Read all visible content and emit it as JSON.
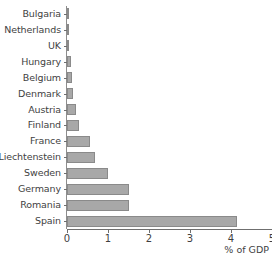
{
  "chart_data": {
    "type": "bar",
    "orientation": "horizontal",
    "title": "",
    "xlabel": "% of GDP",
    "ylabel": "",
    "xlim": [
      0,
      5
    ],
    "xticks": [
      0,
      1,
      2,
      3,
      4,
      5
    ],
    "xtick_labels": [
      "0",
      "1",
      "2",
      "3",
      "4",
      "5"
    ],
    "grid": false,
    "legend": false,
    "bar_color": "#a8a8a8",
    "bar_edge_color": "#8a8a8a",
    "axis_color": "#6f6f6f",
    "text_color": "#3f3f3f",
    "categories": [
      "Bulgaria",
      "Netherlands",
      "UK",
      "Hungary",
      "Belgium",
      "Denmark",
      "Austria",
      "Finland",
      "France",
      "Liechtenstein",
      "Sweden",
      "Germany",
      "Romania",
      "Spain"
    ],
    "values": [
      0.01,
      0.01,
      0.01,
      0.1,
      0.12,
      0.15,
      0.22,
      0.3,
      0.55,
      0.68,
      1.0,
      1.5,
      1.5,
      4.15
    ]
  }
}
